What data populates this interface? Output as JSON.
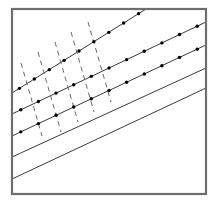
{
  "figure": {
    "caption": "",
    "canvas": {
      "width": 217,
      "height": 204
    },
    "colors": {
      "background": "#ffffff",
      "frame": "#6e6e6e",
      "solid_line": "#3a3a3a",
      "dashed_line": "#6a6a6a",
      "dot": "#000000"
    },
    "frame": {
      "name": "plate-border",
      "x": 12,
      "y": 9,
      "width": 194,
      "height": 185,
      "stroke_width": 2.2
    },
    "solid_lines": [
      {
        "id": "line-1",
        "x1": 12,
        "y1": 93,
        "x2": 146,
        "y2": 9,
        "dotted": true,
        "dot_count": 9
      },
      {
        "id": "line-2",
        "x1": 12,
        "y1": 114,
        "x2": 206,
        "y2": 22,
        "dotted": true,
        "dot_count": 11
      },
      {
        "id": "line-3",
        "x1": 12,
        "y1": 136,
        "x2": 206,
        "y2": 45,
        "dotted": true,
        "dot_count": 11
      },
      {
        "id": "line-4",
        "x1": 12,
        "y1": 157,
        "x2": 206,
        "y2": 68,
        "dotted": false,
        "dot_count": 0
      },
      {
        "id": "line-5",
        "x1": 12,
        "y1": 179,
        "x2": 206,
        "y2": 88,
        "dotted": false,
        "dot_count": 0
      }
    ],
    "dashed_lines": [
      {
        "id": "dash-1",
        "x1": 21,
        "y1": 63,
        "x2": 42,
        "y2": 136
      },
      {
        "id": "dash-2",
        "x1": 38,
        "y1": 52,
        "x2": 61,
        "y2": 132
      },
      {
        "id": "dash-3",
        "x1": 55,
        "y1": 42,
        "x2": 78,
        "y2": 122
      },
      {
        "id": "dash-4",
        "x1": 71,
        "y1": 32,
        "x2": 94,
        "y2": 112
      },
      {
        "id": "dash-5",
        "x1": 88,
        "y1": 22,
        "x2": 111,
        "y2": 102
      }
    ],
    "dash_pattern": {
      "dash": 5,
      "gap": 4,
      "stroke_width": 1.0
    },
    "dot_radius": 1.7,
    "line_stroke_width": 1.0
  }
}
